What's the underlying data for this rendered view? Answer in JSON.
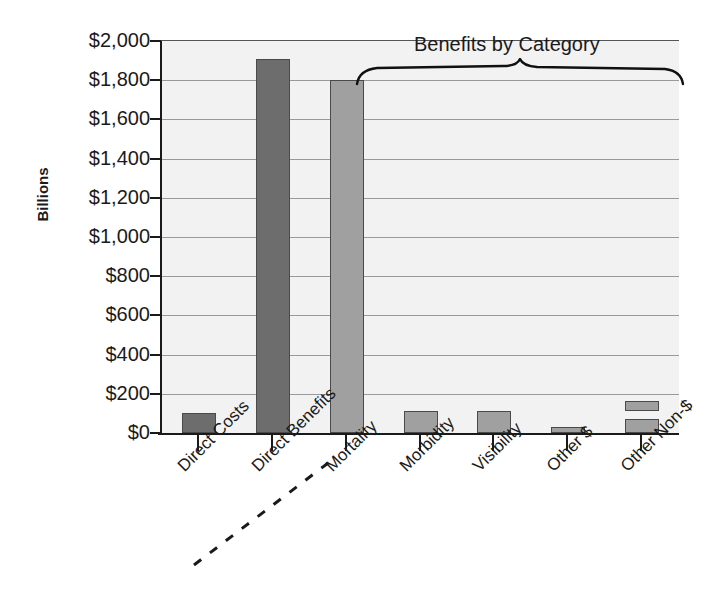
{
  "chart_data": {
    "type": "bar",
    "title": "",
    "xlabel": "",
    "ylabel": "Billions",
    "ylim": [
      0,
      2000
    ],
    "ytick_labels": [
      "$2,000",
      "$1,800",
      "$1,600",
      "$1,400",
      "$1,200",
      "$1,000",
      "$800",
      "$600",
      "$400",
      "$200",
      "$0"
    ],
    "ytick_values": [
      2000,
      1800,
      1600,
      1400,
      1200,
      1000,
      800,
      600,
      400,
      200,
      0
    ],
    "grid": true,
    "legend": "none",
    "categories": [
      "Direct Costs",
      "Direct Benefits",
      "Mortality",
      "Morbidity",
      "Visibility",
      "Other $",
      "Other Non-$"
    ],
    "values": [
      100,
      1910,
      1800,
      110,
      110,
      30,
      190
    ],
    "series": [
      {
        "name": "Values",
        "values": [
          100,
          1910,
          1800,
          110,
          110,
          30,
          190
        ]
      }
    ],
    "stacked_detail": {
      "category": "Other Non-$",
      "segments": [
        70,
        120
      ],
      "note": "final bar rendered as two stacked blocks separated by a white gap"
    },
    "annotations": [
      {
        "text": "Benefits by Category",
        "type": "brace",
        "covers": [
          "Mortality",
          "Morbidity",
          "Visibility",
          "Other $",
          "Other Non-$"
        ]
      },
      {
        "text": "",
        "type": "dashed-separator",
        "between": [
          "Direct Benefits",
          "Mortality"
        ]
      }
    ],
    "colors": {
      "bar_dark": "#6d6d6d",
      "bar_light": "#a0a0a0",
      "plot_background": "#f2f2f2",
      "gridline": "#9a9a9a",
      "axis": "#1a1a1a",
      "text": "#1a1a1a"
    }
  },
  "axis": {
    "y_title": "Billions"
  },
  "annotation": {
    "benefits_label": "Benefits by Category"
  }
}
